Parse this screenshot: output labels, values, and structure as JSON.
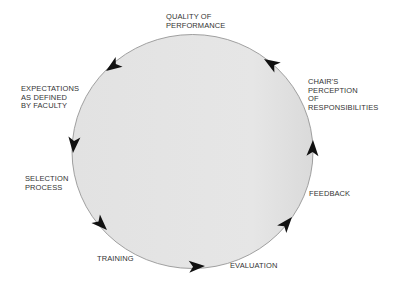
{
  "diagram": {
    "type": "cycle",
    "direction": "counter-clockwise",
    "circle_fill": "#e4e4e4",
    "circle_stroke": "#8a8a8a",
    "arrow_color": "#111111",
    "stages": [
      {
        "id": "quality",
        "label": "QUALITY OF\nPERFORMANCE"
      },
      {
        "id": "expectations",
        "label": "EXPECTATIONS\nAS DEFINED\nBY FACULTY"
      },
      {
        "id": "selection",
        "label": "SELECTION\nPROCESS"
      },
      {
        "id": "training",
        "label": "TRAINING"
      },
      {
        "id": "evaluation",
        "label": "EVALUATION"
      },
      {
        "id": "feedback",
        "label": "FEEDBACK"
      },
      {
        "id": "chairs",
        "label": "CHAIR'S\nPERCEPTION\nOF\nRESPONSIBILITIES"
      }
    ]
  }
}
